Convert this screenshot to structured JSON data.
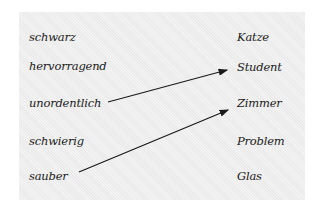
{
  "exercise": {
    "left_column": [
      "schwarz",
      "hervorragend",
      "unordentlich",
      "schwierig",
      "sauber"
    ],
    "right_column": [
      "Katze",
      "Student",
      "Zimmer",
      "Problem",
      "Glas"
    ],
    "connections": [
      {
        "from": "unordentlich",
        "to": "Student"
      },
      {
        "from": "sauber",
        "to": "Zimmer"
      }
    ],
    "colors": {
      "background": "#ffffff",
      "paper": "#efefef",
      "ink": "#1a1a1a"
    }
  }
}
